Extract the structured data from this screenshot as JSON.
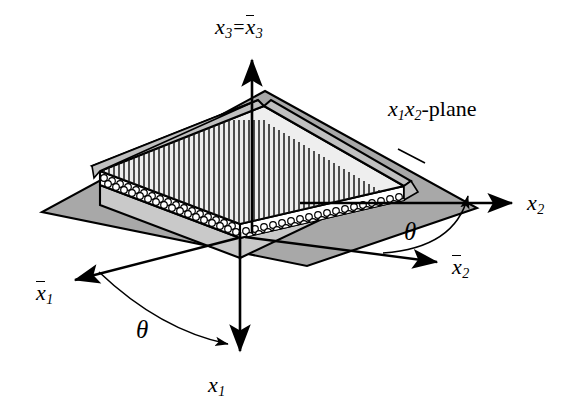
{
  "figure": {
    "kind": "isometric-technical-diagram",
    "background_color": "#ffffff",
    "line_color": "#000000",
    "plane_fill": "#a8a8a8",
    "slab_top_fill": "#eeeeee",
    "slab_edge_fill": "#c9c9c9",
    "fiber_circle_fill": "#ffffff"
  },
  "labels": {
    "x3_axis": {
      "base": "x",
      "sub": "3",
      "equals": "=",
      "bar_base": "x",
      "bar_sub": "3"
    },
    "x2_axis": {
      "base": "x",
      "sub": "2"
    },
    "x2_bar_axis": {
      "base": "x",
      "sub": "2"
    },
    "x1_axis": {
      "base": "x",
      "sub": "1"
    },
    "x1_bar_axis": {
      "base": "x",
      "sub": "1"
    },
    "plane": {
      "x1": "x",
      "sub1": "1",
      "x2": "x",
      "sub2": "2",
      "suffix": "-plane"
    },
    "theta_right": "θ",
    "theta_left": "θ"
  },
  "geometry": {
    "origin": {
      "x": 240,
      "y": 238
    },
    "axes": [
      {
        "name": "x3",
        "from": [
          252,
          233
        ],
        "to": [
          252,
          57
        ],
        "arrow": "end"
      },
      {
        "name": "x1",
        "from": [
          240,
          238
        ],
        "to": [
          240,
          355
        ],
        "arrow": "end"
      },
      {
        "name": "x2",
        "from": [
          300,
          203
        ],
        "to": [
          516,
          203
        ],
        "arrow": "end"
      },
      {
        "name": "x2-bar",
        "from": [
          240,
          238
        ],
        "to": [
          441,
          263
        ],
        "arrow": "end"
      },
      {
        "name": "x1-bar",
        "from": [
          240,
          238
        ],
        "to": [
          70,
          281
        ],
        "arrow": "end"
      }
    ],
    "theta_arcs": [
      {
        "name": "theta-right",
        "center": [
          365,
          203
        ],
        "from_deg": 7,
        "to_deg": -3
      },
      {
        "name": "theta-left",
        "center": [
          240,
          238
        ],
        "from_deg": 180,
        "to_deg": 90
      }
    ]
  }
}
